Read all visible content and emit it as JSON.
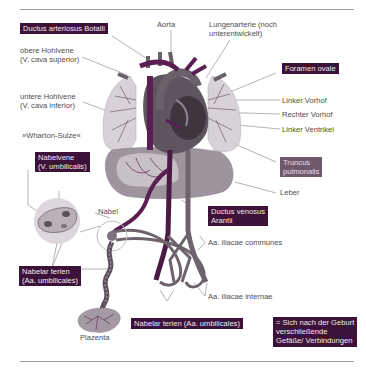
{
  "diagram": {
    "labels": {
      "ductus_arteriosus": "Ductus arteriosus Botalli",
      "aorta": "Aorta",
      "lungenarterie_1": "Lungenarterie (noch",
      "lungenarterie_2": "unterentwickelt)",
      "obere_hohlvene_1": "obere Hohlvene",
      "obere_hohlvene_2": "(V. cava superior)",
      "foramen_ovale": "Foramen ovale",
      "untere_hohlvene_1": "untere Hohlvene",
      "untere_hohlvene_2": "(V. cava inferior)",
      "linker_vorhof": "Linker Vorhof",
      "rechter_vorhof": "Rechter Vorhof",
      "linker_ventrikel": "Linker Ventrikel",
      "wharton_sulze": "»Wharton-Sulze«",
      "truncus_1": "Truncus",
      "truncus_2": "pulmonalis",
      "nabelvene_1": "Nabelvene",
      "nabelvene_2": "(V. umbilicalis)",
      "leber": "Leber",
      "nabel": "Nabel",
      "ductus_venosus_1": "Ductus venosus",
      "ductus_venosus_2": "Arantii",
      "iliacae_communes": "Aa. iliacae communes",
      "nabelarterien_left_1": "Nabelar terien",
      "nabelarterien_left_2": "(Aa. umbilicales)",
      "iliacae_internae": "Aa. iliacae internae",
      "nabelarterien_bottom": "Nabelar terien (Aa. umbilicales)",
      "plazenta": "Plazenta"
    },
    "legend": {
      "line1": "= Sich nach der Geburt",
      "line2": "verschließende",
      "line3": "Gefäße/ Verbindungen"
    },
    "colors": {
      "highlight_box": "#3d1238",
      "truncus_box": "#6f5a6d",
      "vessel_dark": "#5a1e52",
      "vessel_grey": "#6e636c",
      "organ_light": "#d9d2d8",
      "organ_mid": "#a99fa8",
      "rule": "#a79aa6"
    }
  }
}
